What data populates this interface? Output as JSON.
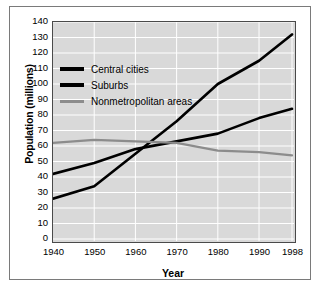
{
  "chart_data": {
    "type": "line",
    "title": "",
    "xlabel": "Year",
    "ylabel": "Population (millions)",
    "x": [
      1940,
      1950,
      1960,
      1970,
      1980,
      1990,
      1998
    ],
    "xtick_labels": [
      "1940",
      "1950",
      "1960",
      "1970",
      "1980",
      "1990",
      "1998"
    ],
    "ytick_labels": [
      "140",
      "130",
      "120",
      "110",
      "100",
      "90",
      "80",
      "70",
      "60",
      "50",
      "40",
      "30",
      "20",
      "10",
      "0"
    ],
    "ylim": [
      0,
      140
    ],
    "ytick_step": 10,
    "grid": true,
    "legend_position": "upper-left-inside",
    "plot_background": "#d9d9d9",
    "gridline_color": "#ffffff",
    "series": [
      {
        "name": "Central cities",
        "color": "#000000",
        "values": [
          42,
          49,
          58,
          63,
          68,
          78,
          84
        ]
      },
      {
        "name": "Suburbs",
        "color": "#000000",
        "values": [
          26,
          34,
          55,
          76,
          100,
          115,
          132
        ]
      },
      {
        "name": "Nonmetropolitan areas",
        "color": "#8c8c8c",
        "values": [
          62,
          64,
          63,
          62,
          57,
          56,
          54
        ]
      }
    ]
  },
  "legend": {
    "items": [
      {
        "label": "Central cities",
        "color": "#000000"
      },
      {
        "label": "Suburbs",
        "color": "#000000"
      },
      {
        "label": "Nonmetropolitan areas",
        "color": "#8c8c8c"
      }
    ]
  }
}
